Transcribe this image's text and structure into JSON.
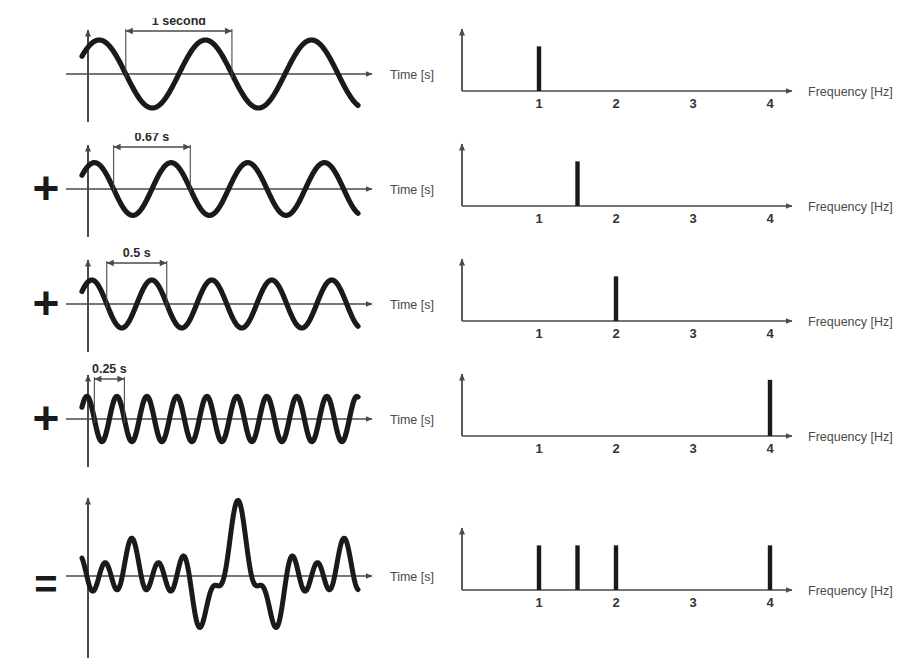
{
  "figure": {
    "background_color": "#ffffff",
    "ink_color": "#231f20",
    "wave_color": "#1a1a1a",
    "axis_color": "#4a4a4a"
  },
  "operators": [
    {
      "row": 2,
      "symbol": "+",
      "name": "plus"
    },
    {
      "row": 3,
      "symbol": "+",
      "name": "plus"
    },
    {
      "row": 4,
      "symbol": "+",
      "name": "plus"
    },
    {
      "row": 5,
      "symbol": "=",
      "name": "equals"
    }
  ],
  "axis_labels": {
    "time": "Time [s]",
    "frequency": "Frequency [Hz]"
  },
  "frequency_ticks": [
    "1",
    "2",
    "3",
    "4"
  ],
  "frequency_tick_values": [
    1,
    2,
    3,
    4
  ],
  "rows": [
    {
      "id": "row-1",
      "operator": "",
      "period_label": "1 second",
      "period_seconds": 1.0,
      "frequency_hz": 1.0,
      "amplitude": 1.0,
      "cycles_shown": 2.6,
      "spectrum": {
        "peaks": [
          {
            "frequency": 1.0,
            "amplitude": 0.62
          }
        ]
      }
    },
    {
      "id": "row-2",
      "operator": "+",
      "period_label": "0.67 s",
      "period_seconds": 0.67,
      "frequency_hz": 1.5,
      "amplitude": 0.85,
      "cycles_shown": 3.6,
      "spectrum": {
        "peaks": [
          {
            "frequency": 1.5,
            "amplitude": 0.62
          }
        ]
      }
    },
    {
      "id": "row-3",
      "operator": "+",
      "period_label": "0.5 s",
      "period_seconds": 0.5,
      "frequency_hz": 2.0,
      "amplitude": 0.8,
      "cycles_shown": 4.6,
      "spectrum": {
        "peaks": [
          {
            "frequency": 2.0,
            "amplitude": 0.62
          }
        ]
      }
    },
    {
      "id": "row-4",
      "operator": "+",
      "period_label": "0.25 s",
      "period_seconds": 0.25,
      "frequency_hz": 4.0,
      "amplitude": 0.78,
      "cycles_shown": 9.2,
      "spectrum": {
        "peaks": [
          {
            "frequency": 4.0,
            "amplitude": 0.78
          }
        ]
      }
    },
    {
      "id": "row-5",
      "operator": "=",
      "period_label": "",
      "period_seconds": null,
      "frequency_hz": null,
      "amplitude": 1.0,
      "cycles_shown": 0,
      "spectrum": {
        "peaks": [
          {
            "frequency": 1.0,
            "amplitude": 0.62
          },
          {
            "frequency": 1.5,
            "amplitude": 0.62
          },
          {
            "frequency": 2.0,
            "amplitude": 0.62
          },
          {
            "frequency": 4.0,
            "amplitude": 0.62
          }
        ]
      }
    }
  ],
  "chart_data": {
    "type": "line",
    "panels": [
      {
        "name": "time-domain",
        "xlabel": "Time [s]",
        "ylabel": "",
        "grid": false,
        "series": [
          {
            "name": "1 Hz sine",
            "period_s": 1.0,
            "frequency_hz": 1.0,
            "amplitude": 1.0,
            "annotation": "1 second"
          },
          {
            "name": "1.5 Hz sine",
            "period_s": 0.67,
            "frequency_hz": 1.5,
            "amplitude": 0.85,
            "annotation": "0.67 s"
          },
          {
            "name": "2 Hz sine",
            "period_s": 0.5,
            "frequency_hz": 2.0,
            "amplitude": 0.8,
            "annotation": "0.5 s"
          },
          {
            "name": "4 Hz sine",
            "period_s": 0.25,
            "frequency_hz": 4.0,
            "amplitude": 0.78,
            "annotation": "0.25 s"
          },
          {
            "name": "sum of all four",
            "period_s": null,
            "frequency_hz": null,
            "amplitude": 1.0,
            "annotation": ""
          }
        ]
      },
      {
        "name": "frequency-domain",
        "xlabel": "Frequency [Hz]",
        "ylabel": "",
        "grid": false,
        "xlim": [
          0,
          4.8
        ],
        "xticks": [
          1,
          2,
          3,
          4
        ],
        "series": [
          {
            "name": "spectrum of 1 Hz sine",
            "x": [
              1.0
            ],
            "values": [
              0.62
            ]
          },
          {
            "name": "spectrum of 1.5 Hz sine",
            "x": [
              1.5
            ],
            "values": [
              0.62
            ]
          },
          {
            "name": "spectrum of 2 Hz sine",
            "x": [
              2.0
            ],
            "values": [
              0.62
            ]
          },
          {
            "name": "spectrum of 4 Hz sine",
            "x": [
              4.0
            ],
            "values": [
              0.78
            ]
          },
          {
            "name": "spectrum of the sum",
            "x": [
              1.0,
              1.5,
              2.0,
              4.0
            ],
            "values": [
              0.62,
              0.62,
              0.62,
              0.62
            ]
          }
        ]
      }
    ]
  }
}
